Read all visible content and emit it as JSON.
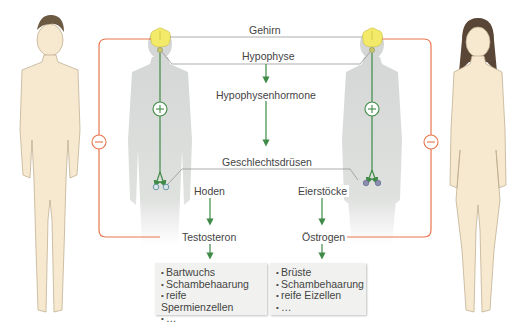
{
  "diagram": {
    "labels": {
      "brain": "Gehirn",
      "pituitary": "Hypophyse",
      "pituitary_hormones": "Hypophysenhormone",
      "gonads": "Geschlechtsdrüsen",
      "testes": "Hoden",
      "ovaries": "Eierstöcke",
      "testosterone": "Testosteron",
      "estrogen": "Östrogen"
    },
    "male_effects": [
      "Bartwuchs",
      "Schambehaarung",
      "reife Spermienzellen",
      "…"
    ],
    "female_effects": [
      "Brüste",
      "Schambehaarung",
      "reife Eizellen",
      "…"
    ],
    "signs": {
      "stimulate": "+",
      "inhibit": "−"
    },
    "colors": {
      "feedback_line": "#e8764e",
      "pathway_arrow": "#3f8a46",
      "brain": "#f3ea6a",
      "silhouette": "#d9dcda",
      "connector_line": "#7a7a7a",
      "box_bg": "#f1f2ef",
      "skin": "#f7e9cf"
    }
  }
}
